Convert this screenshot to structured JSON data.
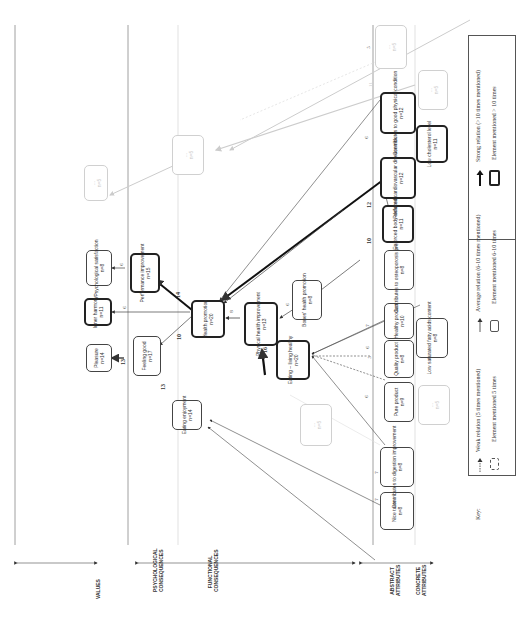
{
  "levels": [
    {
      "id": "values",
      "label": "VALUES"
    },
    {
      "id": "psych",
      "label": "PSYCHOLOGICAL CONSEQUENCES"
    },
    {
      "id": "func",
      "label": "FUNCTIONAL CONSEQUENCES"
    },
    {
      "id": "abstract",
      "label": "ABSTRACT ATTRIBUTES"
    },
    {
      "id": "concrete",
      "label": "CONCRETE ATTRIBUTES"
    }
  ],
  "nodes": [
    {
      "id": "pleasure",
      "label": "Pleasure",
      "n": "n=14",
      "strength": "avg"
    },
    {
      "id": "inner_harmony",
      "label": "Inner harmony",
      "n": "n=11",
      "strength": "strong"
    },
    {
      "id": "psych_satisfaction",
      "label": "Psychological satisfaction",
      "n": "n=8",
      "strength": "avg"
    },
    {
      "id": "feeling_good",
      "label": "Feeling good",
      "n": "n=17",
      "strength": "avg"
    },
    {
      "id": "performance",
      "label": "Performance improvement",
      "n": "n=15",
      "strength": "strong"
    },
    {
      "id": "eating_enjoyment",
      "label": "Eating enjoyment",
      "n": "n=14",
      "strength": "avg"
    },
    {
      "id": "health_promotion",
      "label": "Health promotion",
      "n": "n=20",
      "strength": "strong"
    },
    {
      "id": "physical_health",
      "label": "Physical health improvement",
      "n": "n=13",
      "strength": "strong"
    },
    {
      "id": "bones_health",
      "label": "Bones' health promotion",
      "n": "n=8",
      "strength": "avg"
    },
    {
      "id": "eating_living",
      "label": "Eating – living healthy",
      "n": "n=20",
      "strength": "strong"
    },
    {
      "id": "nice_taste",
      "label": "Nice taste",
      "n": "n=8",
      "strength": "avg"
    },
    {
      "id": "digestion",
      "label": "Contributes to digestion improvement",
      "n": "n=8",
      "strength": "avg"
    },
    {
      "id": "pure_product",
      "label": "Pure product",
      "n": "n=9",
      "strength": "avg"
    },
    {
      "id": "quality_product",
      "label": "Quality product",
      "n": "n=8",
      "strength": "avg"
    },
    {
      "id": "healthy_product",
      "label": "Healthy product",
      "n": "n=10",
      "strength": "avg"
    },
    {
      "id": "low_sat_fat",
      "label": "Low saturated fatty acids content",
      "n": "n=8",
      "strength": "avg"
    },
    {
      "id": "osteoporosis",
      "label": "Contributes to osteoporosis prevention",
      "n": "n=8",
      "strength": "avg"
    },
    {
      "id": "body_defense",
      "label": "Enforced body defense",
      "n": "n=11",
      "strength": "strong"
    },
    {
      "id": "cardio_risk",
      "label": "Reduced cardiovascular disease risk",
      "n": "n=12",
      "strength": "strong"
    },
    {
      "id": "low_cholesterol",
      "label": "Low cholesterol level",
      "n": "n=11",
      "strength": "strong"
    },
    {
      "id": "good_physical",
      "label": "Contributes to good physical condition",
      "n": "n=12",
      "strength": "strong"
    },
    {
      "id": "faded1",
      "label": "...",
      "n": "n=5",
      "strength": "weak"
    },
    {
      "id": "faded2",
      "label": "...",
      "n": "n=5",
      "strength": "weak"
    },
    {
      "id": "faded3",
      "label": "...",
      "n": "n=5",
      "strength": "weak"
    },
    {
      "id": "faded4",
      "label": "...",
      "n": "n=5",
      "strength": "weak"
    },
    {
      "id": "faded5",
      "label": "...",
      "n": "n=5",
      "strength": "weak"
    },
    {
      "id": "faded6",
      "label": "...",
      "n": "n=5",
      "strength": "weak"
    }
  ],
  "edge_labels": {
    "fg_pleasure": "13",
    "ee_fg": "13",
    "hp_fg": "10",
    "hp_perf": "14",
    "hp_inner": "6",
    "perf_psych": "6",
    "ph_hp": "8",
    "el_ph": "16",
    "bones_ph": "6",
    "cardio_hp": "12",
    "defense_hp": "10",
    "good_hp": "6",
    "nice_ee": "7",
    "dig_ee": "7",
    "pure_el": "6",
    "quality_el": "5",
    "healthy_el": "7",
    "lowfat_el": "6",
    "faded_a": "11",
    "faded_b": "5"
  },
  "legend": {
    "key_label": "Key:",
    "weak_relation": "Weak relation (5 times mentioned)",
    "avg_relation": "Average relation (6-10 times mentioned)",
    "strong_relation": "Strong relation (>10 times mentioned)",
    "weak_element": "Element mentioned 5 times",
    "avg_element": "Element mentioned 6-10 times",
    "strong_element": "Element mentioned > 10 times"
  },
  "colors": {
    "strong": "#222222",
    "average": "#444444",
    "weak": "#cccccc",
    "band_line": "#999999"
  }
}
